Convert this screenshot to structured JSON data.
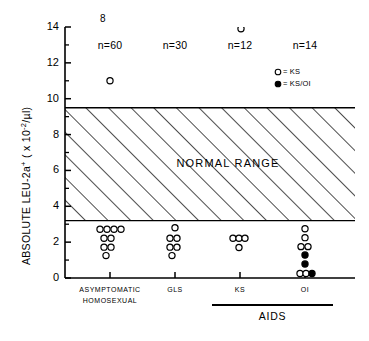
{
  "chart_data": {
    "type": "scatter",
    "title": "",
    "ylabel": "ABSOLUTE LEU-2a",
    "ylabel_sup": "+",
    "ylabel_units": "( x 10",
    "ylabel_units_sup": "-2",
    "ylabel_units_tail": "/µl)",
    "xlabel": "",
    "ylim": [
      0,
      14
    ],
    "ytick_labels": [
      "0",
      "2",
      "4",
      "6",
      "8",
      "10",
      "12",
      "14"
    ],
    "ytick_values": [
      0,
      2,
      4,
      6,
      8,
      10,
      12,
      14
    ],
    "yminor_values": [
      1,
      3,
      5,
      7,
      9,
      11,
      13
    ],
    "grid": false,
    "normal_range": {
      "label": "NORMAL RANGE",
      "low": 3.2,
      "high": 9.5
    },
    "stray_mark": "8",
    "legend": {
      "position": "upper-right",
      "entries": [
        {
          "marker": "open-circle",
          "text": "= KS"
        },
        {
          "marker": "filled-circle",
          "text": "= KS/OI"
        }
      ]
    },
    "group_bracket": {
      "label": "AIDS",
      "spans": [
        "KS",
        "OI"
      ]
    },
    "categories": [
      {
        "id": "asymptomatic-homosexual",
        "label_line1": "ASYMPTOMATIC",
        "label_line2": "HOMOSEXUAL",
        "n_label": "n=60",
        "x": 110,
        "points": [
          {
            "y": 11.0,
            "dx": 0,
            "type": "open"
          },
          {
            "y": 2.72,
            "dx": -10,
            "type": "open"
          },
          {
            "y": 2.72,
            "dx": -3,
            "type": "open"
          },
          {
            "y": 2.72,
            "dx": 4,
            "type": "open"
          },
          {
            "y": 2.72,
            "dx": 11,
            "type": "open"
          },
          {
            "y": 2.22,
            "dx": -6,
            "type": "open"
          },
          {
            "y": 2.22,
            "dx": 1,
            "type": "open"
          },
          {
            "y": 1.72,
            "dx": -6,
            "type": "open"
          },
          {
            "y": 1.72,
            "dx": 1,
            "type": "open"
          },
          {
            "y": 1.25,
            "dx": -4,
            "type": "open"
          }
        ]
      },
      {
        "id": "gls",
        "label_line1": "GLS",
        "label_line2": "",
        "n_label": "n=30",
        "x": 175,
        "points": [
          {
            "y": 2.8,
            "dx": 0,
            "type": "open"
          },
          {
            "y": 2.22,
            "dx": -5,
            "type": "open"
          },
          {
            "y": 2.22,
            "dx": 2,
            "type": "open"
          },
          {
            "y": 1.72,
            "dx": -5,
            "type": "open"
          },
          {
            "y": 1.72,
            "dx": 2,
            "type": "open"
          },
          {
            "y": 1.25,
            "dx": -3,
            "type": "open"
          }
        ]
      },
      {
        "id": "ks",
        "label_line1": "KS",
        "label_line2": "",
        "n_label": "n=12",
        "x": 240,
        "points": [
          {
            "y": 13.9,
            "dx": 1,
            "type": "open"
          },
          {
            "y": 2.22,
            "dx": -7,
            "type": "open"
          },
          {
            "y": 2.22,
            "dx": -1,
            "type": "open"
          },
          {
            "y": 2.22,
            "dx": 5,
            "type": "open"
          },
          {
            "y": 1.7,
            "dx": -1,
            "type": "open"
          }
        ]
      },
      {
        "id": "oi",
        "label_line1": "OI",
        "label_line2": "",
        "n_label": "n=14",
        "x": 305,
        "points": [
          {
            "y": 2.75,
            "dx": 0,
            "type": "open"
          },
          {
            "y": 2.25,
            "dx": 0,
            "type": "open"
          },
          {
            "y": 1.75,
            "dx": -4,
            "type": "open"
          },
          {
            "y": 1.75,
            "dx": 3,
            "type": "open"
          },
          {
            "y": 1.28,
            "dx": 0,
            "type": "filled"
          },
          {
            "y": 0.78,
            "dx": 0,
            "type": "filled"
          },
          {
            "y": 0.25,
            "dx": -5,
            "type": "open"
          },
          {
            "y": 0.25,
            "dx": 1,
            "type": "open"
          },
          {
            "y": 0.25,
            "dx": 7,
            "type": "filled"
          }
        ]
      }
    ]
  }
}
